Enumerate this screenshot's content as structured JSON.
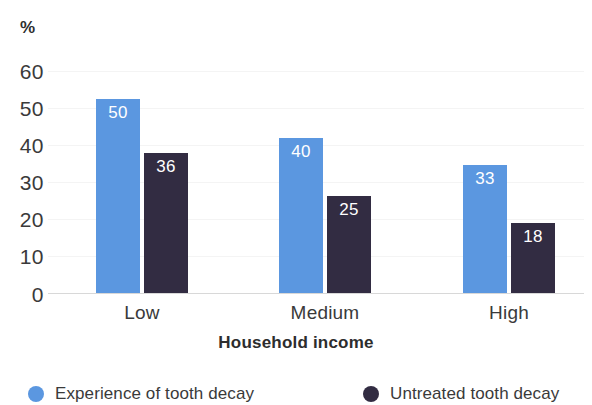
{
  "chart_data": {
    "type": "bar",
    "title": "",
    "subtitle": "",
    "xlabel": "Household income",
    "ylabel": "%",
    "categories": [
      "Low",
      "Medium",
      "High"
    ],
    "series": [
      {
        "name": "Experience of tooth decay",
        "color": "#5b97e0",
        "values": [
          50,
          40,
          33
        ]
      },
      {
        "name": "Untreated tooth decay",
        "color": "#322c42",
        "values": [
          36,
          25,
          18
        ]
      }
    ],
    "ylim": [
      0,
      60
    ],
    "yticks": [
      60,
      50,
      40,
      30,
      20,
      10,
      0
    ],
    "ytick_labels": [
      "60",
      "50",
      "40",
      "30",
      "20",
      "10",
      "0"
    ],
    "grid": "faint-horizontal",
    "legend_position": "bottom",
    "value_labels": "inside-top-white",
    "background_color": "#ffffff",
    "axis_color": "#d8d8d8",
    "text_color": "#3a3a3a"
  }
}
